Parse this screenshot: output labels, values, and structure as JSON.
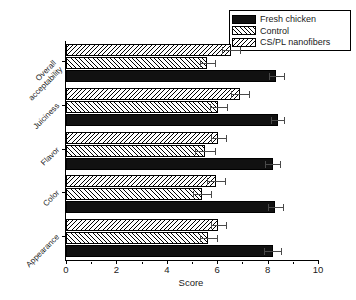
{
  "chart_data": {
    "type": "bar",
    "orientation": "horizontal",
    "title": "",
    "xlabel": "Score",
    "ylabel": "",
    "xlim": [
      0,
      10
    ],
    "xticks": [
      0,
      2,
      4,
      6,
      8,
      10
    ],
    "xtick_labels": [
      "0",
      "2",
      "4",
      "6",
      "8",
      "10"
    ],
    "minor_ticks": true,
    "grid": false,
    "legend_position": "top-right",
    "categories": [
      "Appearance",
      "Color",
      "Flavor",
      "Juiciness",
      "Overall acceptability"
    ],
    "series": [
      {
        "name": "Fresh chicken",
        "pattern": "solid-black",
        "color": "#111111",
        "values": [
          8.2,
          8.3,
          8.2,
          8.4,
          8.35
        ],
        "errors": [
          0.35,
          0.3,
          0.3,
          0.25,
          0.3
        ]
      },
      {
        "name": "Control",
        "pattern": "forward-hatch",
        "color": "#ffffff",
        "values": [
          5.65,
          5.4,
          5.5,
          6.05,
          5.6
        ],
        "errors": [
          0.35,
          0.35,
          0.4,
          0.35,
          0.3
        ]
      },
      {
        "name": "CS/PL nanofibers",
        "pattern": "backward-hatch",
        "color": "#ffffff",
        "values": [
          6.05,
          5.95,
          6.05,
          6.9,
          6.55
        ],
        "errors": [
          0.3,
          0.35,
          0.3,
          0.35,
          0.35
        ]
      }
    ]
  },
  "legend": {
    "items": [
      {
        "label": "Fresh chicken",
        "swatch": "solid-black"
      },
      {
        "label": "Control",
        "swatch": "forward-hatch"
      },
      {
        "label": "CS/PL nanofibers",
        "swatch": "backward-hatch"
      }
    ]
  },
  "axis": {
    "x_title": "Score",
    "x_tick_labels": [
      "0",
      "2",
      "4",
      "6",
      "8",
      "10"
    ],
    "y_category_labels": [
      "Appearance",
      "Color",
      "Flavor",
      "Juiciness",
      "Overall acceptability"
    ]
  }
}
